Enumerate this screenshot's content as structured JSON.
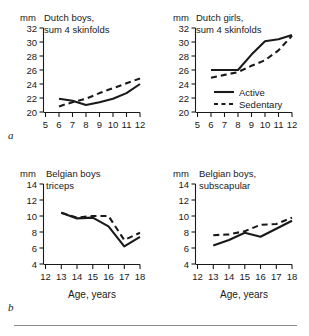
{
  "figure": {
    "panel_letters": {
      "a": "a",
      "b": "b"
    },
    "units_label": "mm",
    "x_axis_label": "Age, years",
    "legend": {
      "active": "Active",
      "sedentary": "Sedentary"
    },
    "ink_color": "#1a1a1a",
    "rule_color": "#8b8b8b"
  },
  "chart_data": [
    {
      "type": "line",
      "panel": "a",
      "position": "top-left",
      "title": "Dutch boys, sum 4 skinfolds",
      "title_line1": "Dutch boys,",
      "title_line2": "sum 4 skinfolds",
      "xlabel": "",
      "ylabel": "mm",
      "xlim": [
        5,
        12
      ],
      "ylim": [
        20,
        32
      ],
      "xticks": [
        5,
        6,
        7,
        8,
        9,
        10,
        11,
        12
      ],
      "xticklabels": [
        "5",
        "6",
        "7",
        "8",
        "9",
        "10",
        "11",
        "12"
      ],
      "yticks": [
        20,
        22,
        24,
        26,
        28,
        30,
        32
      ],
      "yticklabels": [
        "20",
        "22",
        "24",
        "26",
        "28",
        "30",
        "32"
      ],
      "grid": false,
      "legend_position": "none",
      "x": [
        6,
        7,
        8,
        9,
        10,
        11,
        12
      ],
      "series": [
        {
          "name": "Active",
          "style": "solid",
          "values": [
            21.9,
            21.6,
            21.0,
            21.4,
            21.9,
            22.7,
            24.0
          ]
        },
        {
          "name": "Sedentary",
          "style": "dashed",
          "values": [
            20.8,
            21.4,
            21.9,
            22.7,
            23.4,
            24.1,
            24.8
          ]
        }
      ]
    },
    {
      "type": "line",
      "panel": "a",
      "position": "top-right",
      "title": "Dutch girls, sum 4 skinfolds",
      "title_line1": "Dutch girls,",
      "title_line2": "sum 4 skinfolds",
      "xlabel": "",
      "ylabel": "mm",
      "xlim": [
        5,
        12
      ],
      "ylim": [
        20,
        32
      ],
      "xticks": [
        5,
        6,
        7,
        8,
        9,
        10,
        11,
        12
      ],
      "xticklabels": [
        "5",
        "6",
        "7",
        "8",
        "9",
        "10",
        "11",
        "12"
      ],
      "yticks": [
        20,
        22,
        24,
        26,
        28,
        30,
        32
      ],
      "yticklabels": [
        "20",
        "22",
        "24",
        "26",
        "28",
        "30",
        "32"
      ],
      "grid": false,
      "legend_position": "inside-lower-center",
      "x": [
        6,
        7,
        8,
        9,
        10,
        11,
        12
      ],
      "series": [
        {
          "name": "Active",
          "style": "solid",
          "values": [
            26.0,
            26.0,
            26.0,
            28.2,
            30.1,
            30.4,
            31.0
          ]
        },
        {
          "name": "Sedentary",
          "style": "dashed",
          "values": [
            24.9,
            25.3,
            25.7,
            26.6,
            27.4,
            28.8,
            30.9
          ]
        }
      ]
    },
    {
      "type": "line",
      "panel": "b",
      "position": "bottom-left",
      "title": "Belgian boys triceps",
      "title_line1": "Belgian boys",
      "title_line2": "triceps",
      "xlabel": "Age, years",
      "ylabel": "mm",
      "xlim": [
        12,
        18
      ],
      "ylim": [
        4,
        14
      ],
      "xticks": [
        12,
        13,
        14,
        15,
        16,
        17,
        18
      ],
      "xticklabels": [
        "12",
        "13",
        "14",
        "15",
        "16",
        "17",
        "18"
      ],
      "yticks": [
        4,
        6,
        8,
        10,
        12,
        14
      ],
      "yticklabels": [
        "4",
        "6",
        "8",
        "10",
        "12",
        "14"
      ],
      "grid": false,
      "legend_position": "none",
      "x": [
        13,
        14,
        15,
        16,
        17,
        18
      ],
      "series": [
        {
          "name": "Active",
          "style": "solid",
          "values": [
            10.4,
            9.7,
            9.8,
            8.7,
            6.2,
            7.4
          ]
        },
        {
          "name": "Sedentary",
          "style": "dashed",
          "values": [
            10.4,
            9.8,
            10.0,
            10.0,
            7.0,
            7.9
          ]
        }
      ]
    },
    {
      "type": "line",
      "panel": "b",
      "position": "bottom-right",
      "title": "Belgian boys, subscapular",
      "title_line1": "Belgian boys,",
      "title_line2": "subscapular",
      "xlabel": "Age, years",
      "ylabel": "mm",
      "xlim": [
        12,
        18
      ],
      "ylim": [
        4,
        14
      ],
      "xticks": [
        12,
        13,
        14,
        15,
        16,
        17,
        18
      ],
      "xticklabels": [
        "12",
        "13",
        "14",
        "15",
        "16",
        "17",
        "18"
      ],
      "yticks": [
        4,
        6,
        8,
        10,
        12,
        14
      ],
      "yticklabels": [
        "4",
        "6",
        "8",
        "10",
        "12",
        "14"
      ],
      "grid": false,
      "legend_position": "none",
      "x": [
        13,
        14,
        15,
        16,
        17,
        18
      ],
      "series": [
        {
          "name": "Active",
          "style": "solid",
          "values": [
            6.3,
            7.0,
            7.9,
            7.4,
            8.4,
            9.4
          ]
        },
        {
          "name": "Sedentary",
          "style": "dashed",
          "values": [
            7.6,
            7.7,
            8.1,
            8.9,
            9.0,
            9.8
          ]
        }
      ]
    }
  ]
}
